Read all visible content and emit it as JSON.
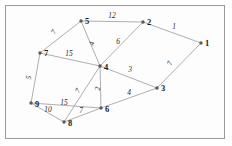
{
  "figure": {
    "width": 232,
    "height": 146,
    "background_color": "#fdfdfd",
    "border_color": "#9a9a9a",
    "node_color": "#5a5a5a",
    "edge_color": "#8d8d8d",
    "label_color": "#1a1a1a"
  },
  "chart_data": {
    "type": "diagram",
    "title": "",
    "xlabel": "",
    "ylabel": "",
    "nodes": [
      {
        "id": "1",
        "label": "1",
        "x": 201,
        "y": 43,
        "label_dx": 4,
        "label_dy": 3
      },
      {
        "id": "2",
        "label": "2",
        "x": 143,
        "y": 22,
        "label_dx": 4,
        "label_dy": 3
      },
      {
        "id": "3",
        "label": "3",
        "x": 157,
        "y": 88,
        "label_dx": 4,
        "label_dy": 3
      },
      {
        "id": "4",
        "label": "4",
        "x": 100,
        "y": 66,
        "label_dx": 4,
        "label_dy": 4
      },
      {
        "id": "5",
        "label": "5",
        "x": 81,
        "y": 21,
        "label_dx": 4,
        "label_dy": 3
      },
      {
        "id": "6",
        "label": "6",
        "x": 101,
        "y": 108,
        "label_dx": 4,
        "label_dy": 4
      },
      {
        "id": "7",
        "label": "7",
        "x": 40,
        "y": 53,
        "label_dx": 4,
        "label_dy": 3
      },
      {
        "id": "8",
        "label": "8",
        "x": 64,
        "y": 122,
        "label_dx": 4,
        "label_dy": 4
      },
      {
        "id": "9",
        "label": "9",
        "x": 31,
        "y": 103,
        "label_dx": 4,
        "label_dy": 4
      }
    ],
    "edges": [
      {
        "from": "5",
        "to": "2",
        "weight": "12",
        "lx": 112,
        "ly": 18,
        "rot": 0
      },
      {
        "from": "2",
        "to": "1",
        "weight": "1",
        "lx": 174,
        "ly": 29,
        "rot": 0
      },
      {
        "from": "1",
        "to": "3",
        "weight": "7",
        "lx": 172,
        "ly": 64,
        "rot": -72
      },
      {
        "from": "5",
        "to": "7",
        "weight": "7",
        "lx": 56,
        "ly": 33,
        "rot": -62
      },
      {
        "from": "5",
        "to": "4",
        "weight": "4",
        "lx": 94,
        "ly": 44,
        "rot": -80
      },
      {
        "from": "2",
        "to": "4",
        "weight": "6",
        "lx": 118,
        "ly": 44,
        "rot": 0
      },
      {
        "from": "7",
        "to": "4",
        "weight": "15",
        "lx": 69,
        "ly": 56,
        "rot": 0
      },
      {
        "from": "7",
        "to": "9",
        "weight": "5",
        "lx": 31,
        "ly": 78,
        "rot": -82
      },
      {
        "from": "4",
        "to": "3",
        "weight": "3",
        "lx": 130,
        "ly": 72,
        "rot": 0
      },
      {
        "from": "4",
        "to": "6",
        "weight": "2",
        "lx": 100,
        "ly": 89,
        "rot": -84
      },
      {
        "from": "4",
        "to": "8",
        "weight": "7",
        "lx": 80,
        "ly": 92,
        "rot": -60
      },
      {
        "from": "9",
        "to": "6",
        "weight": "15",
        "lx": 64,
        "ly": 105,
        "rot": 0
      },
      {
        "from": "9",
        "to": "8",
        "weight": "10",
        "lx": 48,
        "ly": 112,
        "rot": 0
      },
      {
        "from": "8",
        "to": "6",
        "weight": "7",
        "lx": 81,
        "ly": 113,
        "rot": 0
      },
      {
        "from": "6",
        "to": "3",
        "weight": "4",
        "lx": 129,
        "ly": 95,
        "rot": 0
      }
    ]
  }
}
